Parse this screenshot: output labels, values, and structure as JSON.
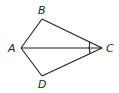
{
  "diagram": {
    "type": "quadrilateral-kite",
    "stroke_color": "#231f20",
    "vertices": {
      "A": {
        "label": "A",
        "x": 21,
        "y": 48
      },
      "B": {
        "label": "B",
        "x": 42,
        "y": 19
      },
      "C": {
        "label": "C",
        "x": 102,
        "y": 48
      },
      "D": {
        "label": "D",
        "x": 42,
        "y": 76
      }
    },
    "segments": [
      "AB",
      "BC",
      "CD",
      "DA",
      "AC"
    ],
    "angle_marks": [
      {
        "vertex": "C",
        "between": [
          "B",
          "A"
        ],
        "arcs": 1
      },
      {
        "vertex": "C",
        "between": [
          "A",
          "D"
        ],
        "arcs": 1
      }
    ]
  }
}
